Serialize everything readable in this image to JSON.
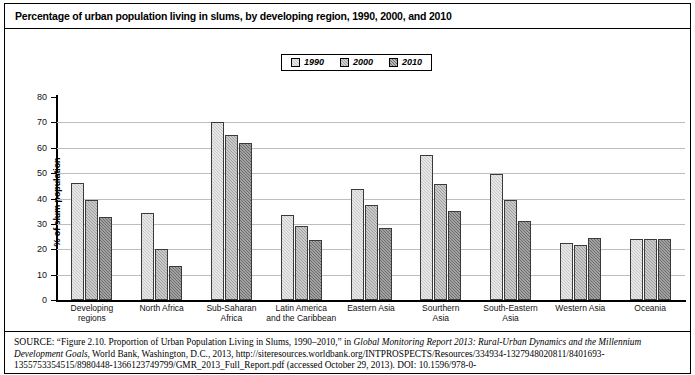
{
  "title": "Percentage of urban population living in slums, by developing region, 1990, 2000, and 2010",
  "legend": {
    "position": "top-center",
    "entries": [
      {
        "label": "1990",
        "color": "#c9c9c9"
      },
      {
        "label": "2000",
        "color": "#9e9e9e"
      },
      {
        "label": "2010",
        "color": "#6e6e6e"
      }
    ]
  },
  "axes": {
    "ylabel": "% of slum population",
    "yticks": [
      "0",
      "10",
      "20",
      "30",
      "40",
      "50",
      "60",
      "70",
      "80"
    ]
  },
  "source": {
    "prefix": "SOURCE:",
    "part1": " “Figure 2.10. Proportion of Urban Population Living in Slums, 1990–2010,” in ",
    "italic1": "Global Monitoring Report 2013: Rural-Urban Dynamics and the Millennium Development Goals",
    "part2": ", World Bank, Washington, D.C., 2013, http://siteresources.worldbank.org/INTPROSPECTS/Resources/334934-1327948020811/8401693-1355753354515/8980448-1366123749799/GMR_2013_Full_Report.pdf (accessed October 29, 2013). DOI: 10.1596/978-0-"
  },
  "chart_data": {
    "type": "bar",
    "title": "Percentage of urban population living in slums, by developing region, 1990, 2000, and 2010",
    "xlabel": "",
    "ylabel": "% of slum population",
    "ylim": [
      0,
      80
    ],
    "ytick_step": 10,
    "grid": true,
    "legend_position": "top-center",
    "categories": [
      "Developing regions",
      "North Africa",
      "Sub-Saharan Africa",
      "Latin America and the Caribbean",
      "Eastern Asia",
      "Sourthern Asia",
      "South-Eastern Asia",
      "Western Asia",
      "Oceania"
    ],
    "category_lines": [
      [
        "Developing",
        "regions"
      ],
      [
        "North Africa"
      ],
      [
        "Sub-Saharan",
        "Africa"
      ],
      [
        "Latin America",
        "and the Caribbean"
      ],
      [
        "Eastern Asia"
      ],
      [
        "Sourthern",
        "Asia"
      ],
      [
        "South-Eastern",
        "Asia"
      ],
      [
        "Western Asia"
      ],
      [
        "Oceania"
      ]
    ],
    "series": [
      {
        "name": "1990",
        "color": "#c9c9c9",
        "values": [
          46.1,
          34.4,
          70.0,
          33.7,
          43.7,
          57.2,
          49.5,
          22.5,
          24.1
        ]
      },
      {
        "name": "2000",
        "color": "#9e9e9e",
        "values": [
          39.4,
          20.3,
          65.0,
          29.2,
          37.4,
          45.8,
          39.6,
          21.6,
          24.1
        ]
      },
      {
        "name": "2010",
        "color": "#6e6e6e",
        "values": [
          32.7,
          13.3,
          61.7,
          23.5,
          28.2,
          35.0,
          31.0,
          24.6,
          24.1
        ]
      }
    ]
  }
}
